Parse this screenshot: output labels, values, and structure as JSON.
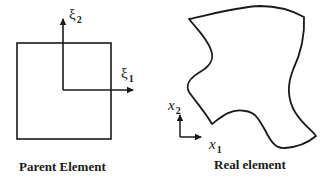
{
  "diagram": {
    "colors": {
      "stroke": "#1a1a1a",
      "background": "#ffffff"
    },
    "parent_element": {
      "caption": "Parent Element",
      "axes": {
        "xi1": {
          "symbol": "ξ",
          "subscript": "1"
        },
        "xi2": {
          "symbol": "ξ",
          "subscript": "2"
        }
      }
    },
    "real_element": {
      "caption": "Real element",
      "axes": {
        "x1": {
          "symbol": "x",
          "subscript": "1"
        },
        "x2": {
          "symbol": "x",
          "subscript": "2"
        }
      }
    }
  }
}
